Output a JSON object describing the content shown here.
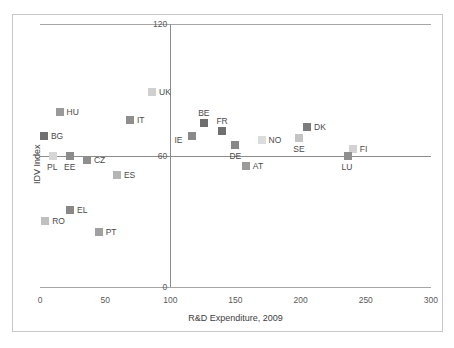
{
  "chart_data": {
    "type": "scatter",
    "title": "",
    "xlabel": "R&D Expenditure, 2009",
    "ylabel": "IDV Index",
    "xlim": [
      0,
      300
    ],
    "ylim": [
      0,
      120
    ],
    "xticks": [
      "0",
      "50",
      "100",
      "150",
      "200",
      "250",
      "300"
    ],
    "xtick_values": [
      0,
      50,
      100,
      150,
      200,
      250,
      300
    ],
    "yticks": [
      "0",
      "60",
      "120"
    ],
    "ytick_values": [
      0,
      60,
      120
    ],
    "grid": false,
    "legend": "none",
    "reference_lines": {
      "horizontal_y": 60,
      "vertical_x": 100
    },
    "points": [
      {
        "label": "UK",
        "x": 86,
        "y": 89,
        "color": "#d0d0d0",
        "label_pos": "right"
      },
      {
        "label": "HU",
        "x": 15,
        "y": 80,
        "color": "#9a9a9a",
        "label_pos": "right"
      },
      {
        "label": "IT",
        "x": 69,
        "y": 76,
        "color": "#8f8f8f",
        "label_pos": "right"
      },
      {
        "label": "BE",
        "x": 126,
        "y": 75,
        "color": "#6e6e6e",
        "label_pos": "above"
      },
      {
        "label": "FR",
        "x": 140,
        "y": 71,
        "color": "#6f6f6f",
        "label_pos": "above"
      },
      {
        "label": "BG",
        "x": 3,
        "y": 69,
        "color": "#707070",
        "label_pos": "right"
      },
      {
        "label": "DK",
        "x": 205,
        "y": 73,
        "color": "#7b7b7b",
        "label_pos": "right"
      },
      {
        "label": "IE",
        "x": 117,
        "y": 69,
        "color": "#8a8a8a",
        "label_pos": "left"
      },
      {
        "label": "NO",
        "x": 170,
        "y": 67,
        "color": "#dcdcdc",
        "label_pos": "right"
      },
      {
        "label": "SE",
        "x": 199,
        "y": 68,
        "color": "#c4c4c4",
        "label_pos": "below"
      },
      {
        "label": "DE",
        "x": 150,
        "y": 65,
        "color": "#888888",
        "label_pos": "below"
      },
      {
        "label": "FI",
        "x": 240,
        "y": 63,
        "color": "#d2d2d2",
        "label_pos": "right"
      },
      {
        "label": "PL",
        "x": 10,
        "y": 60,
        "color": "#d6d6d6",
        "label_pos": "below"
      },
      {
        "label": "EE",
        "x": 23,
        "y": 60,
        "color": "#8c8c8c",
        "label_pos": "below"
      },
      {
        "label": "LU",
        "x": 236,
        "y": 60,
        "color": "#909090",
        "label_pos": "below"
      },
      {
        "label": "CZ",
        "x": 36,
        "y": 58,
        "color": "#8e8e8e",
        "label_pos": "right"
      },
      {
        "label": "AT",
        "x": 158,
        "y": 55,
        "color": "#9b9b9b",
        "label_pos": "right"
      },
      {
        "label": "ES",
        "x": 59,
        "y": 51,
        "color": "#b5b5b5",
        "label_pos": "right"
      },
      {
        "label": "EL",
        "x": 23,
        "y": 35,
        "color": "#888888",
        "label_pos": "right"
      },
      {
        "label": "RO",
        "x": 4,
        "y": 30,
        "color": "#c0c0c0",
        "label_pos": "right"
      },
      {
        "label": "PT",
        "x": 45,
        "y": 25,
        "color": "#a0a0a0",
        "label_pos": "right"
      }
    ]
  },
  "colors": {
    "axis": "#8c8c8c",
    "frame": "#c8c8c8",
    "tick_text": "#5a5a5a",
    "title_text": "#3d3d3d",
    "background": "#ffffff"
  }
}
